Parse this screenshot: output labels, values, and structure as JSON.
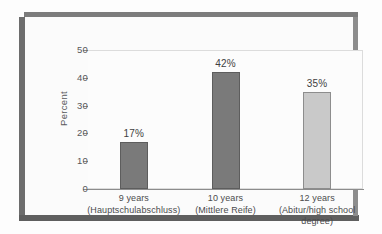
{
  "figure": {
    "axis_title": "Percent"
  },
  "chart_data": {
    "type": "bar",
    "title": "",
    "xlabel": "",
    "ylabel": "Percent",
    "ylim": [
      0,
      50
    ],
    "yticks": [
      0,
      10,
      20,
      30,
      40,
      50
    ],
    "ytick_labels": [
      "0",
      "10",
      "20",
      "30",
      "40",
      "50"
    ],
    "grid": false,
    "legend": "none",
    "categories": [
      "9 years (Hauptschulabschluss)",
      "10 years (Mittlere Reife)",
      "12 years (Abitur/high school degree)"
    ],
    "category_lines": [
      {
        "l1": "9 years",
        "l2": "(Hauptschulabschluss)",
        "l3": ""
      },
      {
        "l1": "10 years",
        "l2": "(Mittlere Reife)",
        "l3": ""
      },
      {
        "l1": "12 years",
        "l2": "(Abitur/high school",
        "l3": "degree)"
      }
    ],
    "values": [
      17,
      42,
      35
    ],
    "value_labels": [
      "17%",
      "42%",
      "35%"
    ],
    "bar_colors": [
      "#7a7a7a",
      "#7a7a7a",
      "#c9c9c9"
    ],
    "bar_edge_colors": [
      "#5d5d5d",
      "#5d5d5d",
      "#8d8d8d"
    ]
  }
}
